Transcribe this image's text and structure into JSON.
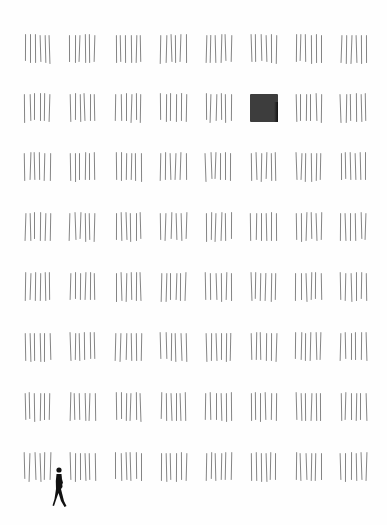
{
  "scene": {
    "description": "Minimalist illustration: 8x8 grid of tally-mark groups, one replaced by a dark square, a small walking silhouette at bottom left",
    "background": "#fefefe",
    "grid": {
      "columns": 8,
      "rows": 8,
      "col_x": [
        24,
        69,
        115,
        160,
        205,
        250,
        295,
        340
      ],
      "row_y": [
        34,
        93,
        152,
        212,
        272,
        332,
        392,
        452
      ],
      "marks_per_group": 6,
      "mark_color": "#6e6e6e"
    },
    "highlight_square": {
      "row": 1,
      "col": 5,
      "color": "#3d3d3d"
    },
    "person": {
      "x": 52,
      "y": 467,
      "width": 16,
      "height": 42,
      "color": "#111111"
    }
  }
}
